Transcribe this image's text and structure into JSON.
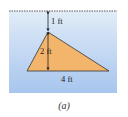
{
  "figure": {
    "caption": "(a)",
    "labels": {
      "depth_to_apex": "1 ft",
      "triangle_height": "2 ft",
      "triangle_base": "4 ft"
    },
    "colors": {
      "water_top": "#e1ecf7",
      "water_bottom": "#a7c5ee",
      "surface_line": "#555555",
      "triangle_fill": "#f2b56b",
      "triangle_stroke": "#333333",
      "arrow": "#222222",
      "text": "#222222"
    },
    "geometry": {
      "panel": {
        "x": 9,
        "y": 10,
        "w": 108,
        "h": 83
      },
      "surface_y": 11,
      "apex": [
        48,
        32
      ],
      "base_left": [
        27,
        71
      ],
      "base_right": [
        109,
        71
      ]
    }
  }
}
